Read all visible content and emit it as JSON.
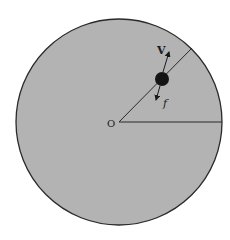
{
  "diagram": {
    "type": "rotating-disk",
    "colors": {
      "disk_fill": "#b3b3b3",
      "stroke": "#2a2a2a",
      "ball": "#141414",
      "background": "#ffffff"
    },
    "labels": {
      "center": "O",
      "velocity": "V",
      "friction": "f"
    }
  }
}
